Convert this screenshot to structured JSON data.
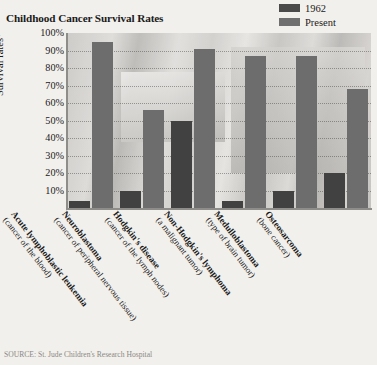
{
  "chart_data": {
    "type": "bar",
    "title": "Childhood Cancer Survival Rates",
    "xlabel": "",
    "ylabel": "Survival rates*",
    "ylim": [
      0,
      100
    ],
    "grid": true,
    "legend_position": "top-right",
    "ytick_labels": [
      "100%",
      "90%",
      "80%",
      "70%",
      "60%",
      "50%",
      "40%",
      "30%",
      "20%",
      "10%"
    ],
    "ytick_values": [
      100,
      90,
      80,
      70,
      60,
      50,
      40,
      30,
      20,
      10
    ],
    "categories": [
      "Acute lymphoblastic leukemia",
      "Neuroblastoma",
      "Hodgkin's disease",
      "Non-Hodgkin's lymphoma",
      "Medulloblastoma",
      "Osteosarcoma"
    ],
    "category_subtitles": [
      "(cancer of the blood)",
      "(cancer of peripheral nervous tissue)",
      "(cancer of the lymph nodes)",
      "(a malignant tumor)",
      "(type of brain tumor)",
      "(bone cancer)"
    ],
    "series": [
      {
        "name": "1962",
        "color": "#414141",
        "values": [
          4,
          10,
          50,
          4,
          10,
          20
        ]
      },
      {
        "name": "Present",
        "color": "#6d6d6d",
        "values": [
          95,
          56,
          91,
          87,
          87,
          68
        ]
      }
    ],
    "source": "SOURCE: St. Jude Children's Research Hospital"
  },
  "legend": {
    "items": [
      {
        "label": "1962",
        "swatch": "legend-swatch-1962"
      },
      {
        "label": "Present",
        "swatch": "legend-swatch-present"
      }
    ]
  }
}
